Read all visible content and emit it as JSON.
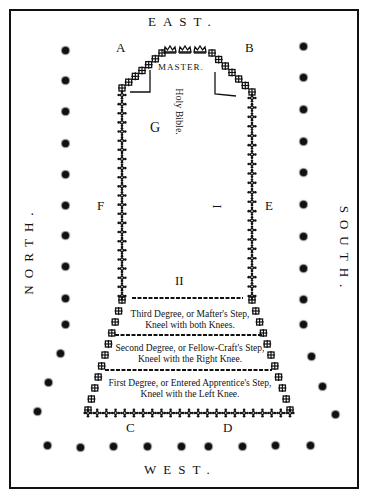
{
  "compass": {
    "east": "EAST.",
    "west": "WEST.",
    "north": "NORTH.",
    "south": "SOUTH."
  },
  "corners": {
    "a": "A",
    "b": "B",
    "c": "C",
    "d": "D"
  },
  "inner_labels": {
    "master": "MASTER.",
    "holy_bible": "Holy Bible.",
    "g": "G",
    "f": "F",
    "e": "E",
    "i": "I",
    "ii": "II"
  },
  "steps": [
    {
      "line1": "Third Degree, or Mafter's Step,",
      "line2": "Kneel with both Knees."
    },
    {
      "line1": "Second Degree, or Fellow-Craft's Step,",
      "line2": "Kneel with the Right Knee."
    },
    {
      "line1": "First Degree, or Entered Apprentice's Step,",
      "line2": "Kneel with the Left Knee."
    }
  ],
  "colors": {
    "ink": "#111111",
    "paper": "#ffffff"
  }
}
